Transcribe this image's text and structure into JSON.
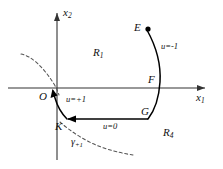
{
  "figure": {
    "name": "phase-plane-switching-diagram",
    "axes": {
      "x_axis_label": "x",
      "x_axis_sub": "1",
      "y_axis_label": "x",
      "y_axis_sub": "2",
      "origin_label": "O"
    },
    "points": [
      {
        "id": "E",
        "label": "E",
        "x": 146,
        "y": 28
      },
      {
        "id": "F",
        "label": "F",
        "x": 156,
        "y": 82
      },
      {
        "id": "G",
        "label": "G",
        "x": 150,
        "y": 113
      },
      {
        "id": "K",
        "label": "K",
        "x": 62,
        "y": 128
      },
      {
        "id": "O",
        "label": "O",
        "x": 48,
        "y": 98
      }
    ],
    "regions": [
      {
        "id": "R1",
        "label": "R",
        "sub": "1",
        "x": 98,
        "y": 53
      },
      {
        "id": "R4",
        "label": "R",
        "sub": "4",
        "x": 168,
        "y": 134
      }
    ],
    "control_labels": [
      {
        "id": "u-minus-1",
        "text": "u=-1",
        "x": 163,
        "y": 47
      },
      {
        "id": "u-plus-1",
        "text": "u=+1",
        "x": 68,
        "y": 101
      },
      {
        "id": "u-zero",
        "text": "u=0",
        "x": 108,
        "y": 124
      }
    ],
    "curves": [
      {
        "id": "gamma-plus-1",
        "label": "γ",
        "sub": "+1",
        "style": "dashed",
        "label_x": 76,
        "label_y": 142
      }
    ],
    "colors": {
      "axis": "#333333",
      "trajectory": "#000000",
      "dashed": "#555555",
      "text": "#111111",
      "background": "#ffffff"
    }
  }
}
